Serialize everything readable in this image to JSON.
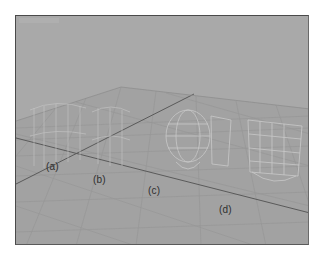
{
  "viewport": {
    "view_name": "",
    "colors": {
      "sky": "#a9a9a9",
      "ground": "#a2a2a2",
      "grid_minor": "#989898",
      "grid_major": "#5c5c5c",
      "wireframe": "#c8c8c8",
      "border": "#4a4a4a",
      "label": "#2e2e2e"
    }
  },
  "objects": [
    {
      "id": "a",
      "label": "(a)",
      "x": 30,
      "y": 151
    },
    {
      "id": "b",
      "label": "(b)",
      "x": 77,
      "y": 164
    },
    {
      "id": "c",
      "label": "(c)",
      "x": 132,
      "y": 175
    },
    {
      "id": "d",
      "label": "(d)",
      "x": 203,
      "y": 194
    }
  ]
}
